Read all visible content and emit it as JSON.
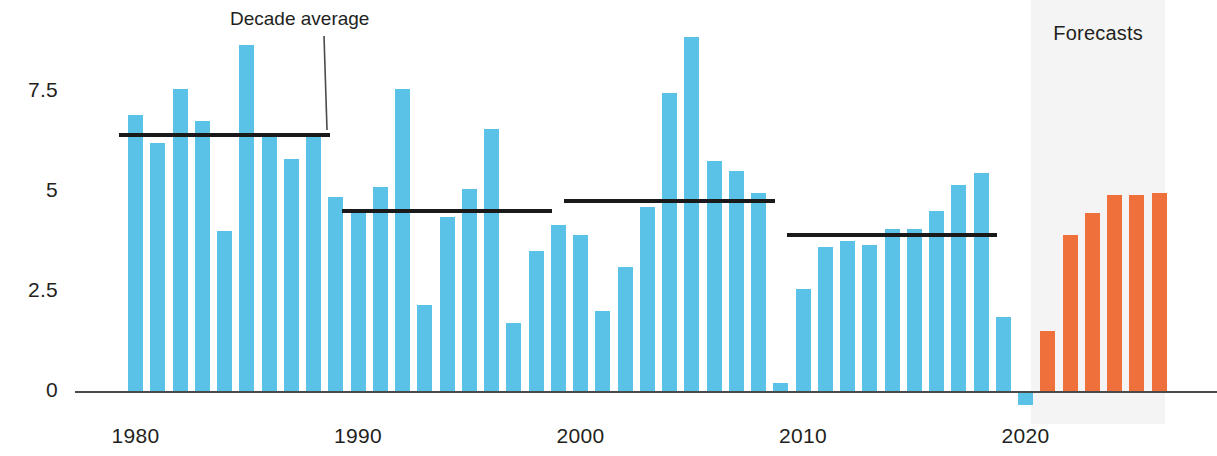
{
  "chart_data": {
    "type": "bar",
    "title": "",
    "subtitle": "",
    "xlabel": "",
    "ylabel": "",
    "ylim": [
      -0.6,
      9.0
    ],
    "xlim": [
      1979.3,
      2026.7
    ],
    "grid": false,
    "legend": "none",
    "y_ticks": [
      "0",
      "2.5",
      "5",
      "7.5"
    ],
    "y_tick_values": [
      0,
      2.5,
      5,
      7.5
    ],
    "x_ticks": [
      "1980",
      "1990",
      "2000",
      "2010",
      "2020"
    ],
    "x_tick_values": [
      1980,
      1990,
      2000,
      2010,
      2020
    ],
    "colors": {
      "actual": "#5ac2e7",
      "forecast": "#f0703c",
      "average_line": "#1a1a1a",
      "axis": "#4a4a4a",
      "forecast_band": "#ededed",
      "text": "#231f20"
    },
    "series": [
      {
        "name": "Actual",
        "color": "#5ac2e7",
        "x": [
          1980,
          1981,
          1982,
          1983,
          1984,
          1985,
          1986,
          1987,
          1988,
          1989,
          1990,
          1991,
          1992,
          1993,
          1994,
          1995,
          1996,
          1997,
          1998,
          1999,
          2000,
          2001,
          2002,
          2003,
          2004,
          2005,
          2006,
          2007,
          2008,
          2009,
          2010,
          2011,
          2012,
          2013,
          2014,
          2015,
          2016,
          2017,
          2018,
          2019,
          2020
        ],
        "values": [
          6.9,
          6.2,
          7.55,
          6.75,
          4.0,
          8.65,
          6.35,
          5.8,
          6.35,
          4.85,
          4.5,
          5.1,
          7.55,
          2.15,
          4.35,
          5.05,
          6.55,
          1.7,
          3.5,
          4.15,
          3.9,
          2.0,
          3.1,
          4.6,
          7.45,
          8.85,
          5.75,
          5.5,
          4.95,
          0.2,
          2.55,
          3.6,
          3.75,
          3.65,
          4.05,
          4.05,
          4.5,
          5.15,
          5.45,
          1.85,
          -0.35
        ]
      },
      {
        "name": "Forecasts",
        "color": "#f0703c",
        "x": [
          2021,
          2022,
          2023,
          2024,
          2025,
          2026
        ],
        "values": [
          1.5,
          3.9,
          4.45,
          4.9,
          4.9,
          4.95
        ]
      }
    ],
    "decade_averages": [
      {
        "label": "1980s",
        "x_start": 1979.6,
        "x_end": 1988.4,
        "value": 6.4
      },
      {
        "label": "1990s",
        "x_start": 1989.6,
        "x_end": 1998.4,
        "value": 4.5
      },
      {
        "label": "2000s",
        "x_start": 1999.6,
        "x_end": 2008.4,
        "value": 4.75
      },
      {
        "label": "2010s",
        "x_start": 2009.6,
        "x_end": 2018.4,
        "value": 3.9
      }
    ],
    "annotations": [
      {
        "name": "decade-average",
        "text": "Decade average",
        "text_x": 230,
        "text_y": 8,
        "leader_from": [
          324,
          36
        ],
        "leader_to": [
          327,
          130
        ]
      }
    ],
    "forecast_band": {
      "label": "Forecasts",
      "x_start": 2020.6,
      "x_end": 2026.6
    }
  }
}
